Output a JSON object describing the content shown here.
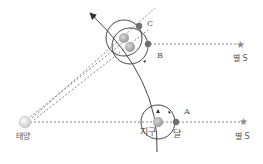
{
  "labels": {
    "sun": "태양",
    "earth": "지구",
    "moon": "달",
    "star_top": "별 S",
    "star_bottom": "별 S",
    "point_a": "A",
    "point_b": "B",
    "point_c": "C"
  },
  "colors": {
    "line": "#333333",
    "dashed": "#666666",
    "sun": "#dcdcdc",
    "earth": "#b0b0b0",
    "moon": "#707070",
    "star": "#888888"
  }
}
